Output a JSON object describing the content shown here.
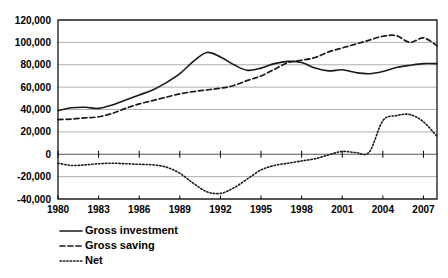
{
  "chart_data": {
    "type": "line",
    "title": "",
    "subtitle": "",
    "xlabel": "",
    "ylabel": "",
    "xlim": [
      1980,
      2008
    ],
    "ylim": [
      -40000,
      120000
    ],
    "grid": true,
    "legend_position": "bottom-left",
    "y_ticks": [
      120000,
      100000,
      80000,
      60000,
      40000,
      20000,
      0,
      -20000,
      -40000
    ],
    "y_tick_labels": [
      "120,000",
      "100,000",
      "80,000",
      "60,000",
      "40,000",
      "20,000",
      "0",
      "-20,000",
      "-40,000"
    ],
    "x_ticks": [
      1980,
      1983,
      1986,
      1989,
      1992,
      1995,
      1998,
      2001,
      2004,
      2007
    ],
    "x_tick_labels": [
      "1980",
      "1983",
      "1986",
      "1989",
      "1992",
      "1995",
      "1998",
      "2001",
      "2004",
      "2007"
    ],
    "x": [
      1980,
      1981,
      1982,
      1983,
      1984,
      1985,
      1986,
      1987,
      1988,
      1989,
      1990,
      1991,
      1992,
      1993,
      1994,
      1995,
      1996,
      1997,
      1998,
      1999,
      2000,
      2001,
      2002,
      2003,
      2004,
      2005,
      2006,
      2007,
      2008
    ],
    "series": [
      {
        "name": "Gross investment",
        "style": "solid",
        "color": "#1a1a1a",
        "values": [
          39000,
          41500,
          42000,
          41000,
          44000,
          48500,
          53000,
          57500,
          64000,
          72000,
          83000,
          91000,
          87000,
          80000,
          75000,
          77000,
          81000,
          83000,
          82000,
          77000,
          74500,
          75500,
          73000,
          72000,
          74000,
          77500,
          79500,
          81000,
          81000
        ]
      },
      {
        "name": "Gross saving",
        "style": "dashed",
        "color": "#1a1a1a",
        "values": [
          31000,
          31500,
          32500,
          33500,
          36500,
          41000,
          45000,
          48000,
          51000,
          54000,
          56000,
          57500,
          59000,
          61500,
          66000,
          70000,
          76000,
          82000,
          84000,
          86500,
          91500,
          95000,
          98500,
          102000,
          105500,
          106000,
          100000,
          104000,
          97000
        ]
      },
      {
        "name": "Net",
        "style": "dotted",
        "color": "#1a1a1a",
        "values": [
          -8000,
          -10000,
          -9500,
          -8500,
          -8000,
          -8500,
          -9000,
          -9500,
          -11500,
          -17000,
          -26000,
          -33500,
          -35000,
          -30000,
          -22000,
          -14000,
          -10000,
          -8000,
          -6000,
          -4000,
          -500,
          2500,
          1500,
          2000,
          8000,
          16000,
          22000,
          24000,
          24500
        ]
      }
    ],
    "series_extra_tail": {
      "Net": {
        "x": [
          2004,
          2005,
          2006,
          2007,
          2008
        ],
        "values": [
          30000,
          34500,
          35500,
          29000,
          16000
        ]
      }
    },
    "legend": [
      {
        "label": "Gross investment",
        "style": "solid"
      },
      {
        "label": "Gross saving",
        "style": "dashed"
      },
      {
        "label": "Net",
        "style": "dotted"
      }
    ]
  }
}
